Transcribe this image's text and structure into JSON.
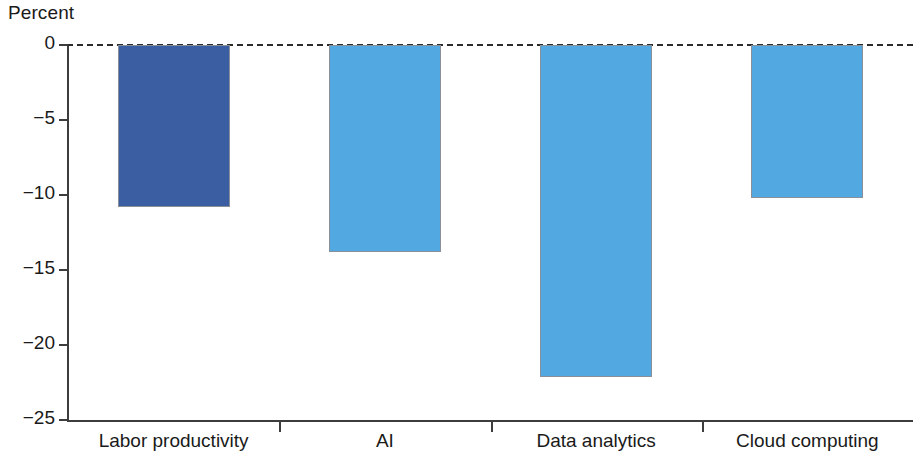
{
  "chart_data": {
    "type": "bar",
    "title": "",
    "ylabel": "Percent",
    "xlabel": "",
    "categories": [
      "Labor productivity",
      "AI",
      "Data analytics",
      "Cloud computing"
    ],
    "values": [
      -10.8,
      -13.8,
      -22.1,
      -10.2
    ],
    "ylim": [
      -25,
      0
    ],
    "yticks": [
      0,
      -5,
      -10,
      -15,
      -20,
      -25
    ],
    "ytick_labels": [
      "0",
      "−5",
      "−10",
      "−15",
      "−20",
      "−25"
    ],
    "grid": false,
    "legend": null,
    "zero_reference_line": true,
    "bar_colors": [
      "#3b5ea3",
      "#52a9e2",
      "#52a9e2",
      "#52a9e2"
    ],
    "series": [
      {
        "name": "Percent change",
        "values": [
          -10.8,
          -13.8,
          -22.1,
          -10.2
        ]
      }
    ]
  },
  "colors": {
    "bar_primary": "#3b5ea3",
    "bar_secondary": "#52a9e2",
    "axis": "#3d3d3d",
    "text": "#1a1a1a",
    "bar_border": "#8a9099",
    "background": "#ffffff"
  },
  "axis": {
    "y_title": "Percent"
  }
}
